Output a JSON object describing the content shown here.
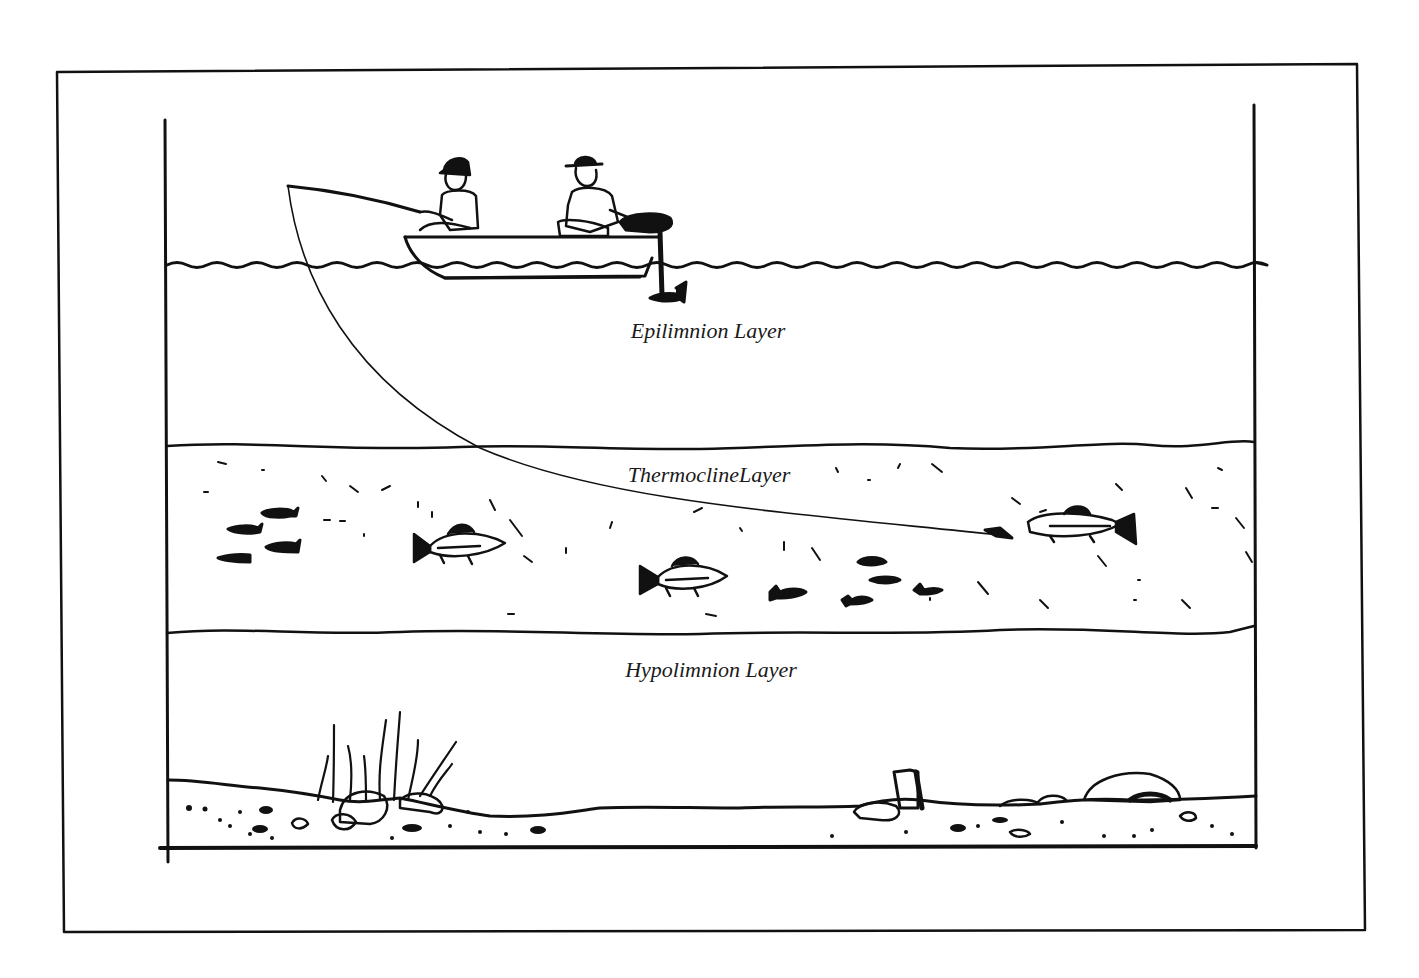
{
  "diagram": {
    "layers": [
      {
        "id": "epilimnion",
        "label": "Epilimnion Layer",
        "x": 708,
        "y": 318
      },
      {
        "id": "thermocline",
        "label": "ThermoclineLayer",
        "x": 709,
        "y": 462
      },
      {
        "id": "hypolimnion",
        "label": "Hypolimnion Layer",
        "x": 711,
        "y": 657
      }
    ],
    "elements": {
      "boat": "rowboat-with-outboard-motor",
      "people": [
        "angler-with-cap",
        "man-with-hat"
      ],
      "fishing_line": "line-descending-into-thermocline",
      "fish": [
        "small-baitfish-school",
        "perch-left",
        "perch-center",
        "trout-on-lure",
        "small-baitfish-right"
      ],
      "bottom": [
        "aquatic-weeds",
        "rocks",
        "stump",
        "boulder"
      ]
    },
    "colors": {
      "ink": "#111111",
      "background": "#ffffff"
    }
  }
}
